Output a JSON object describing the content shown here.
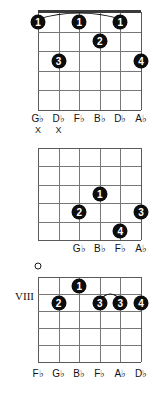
{
  "chart_data": {
    "type": "diagram",
    "subtype": "guitar-chord-charts",
    "string_count": 6,
    "fret_count": 5,
    "diagrams": [
      {
        "id": "diagram-1",
        "position_label": "",
        "has_nut": true,
        "barre": {
          "from_string": 1,
          "to_string": 5,
          "fret": 1
        },
        "dots": [
          {
            "string": 1,
            "fret": 1,
            "finger": "1"
          },
          {
            "string": 3,
            "fret": 1,
            "finger": "1"
          },
          {
            "string": 5,
            "fret": 1,
            "finger": "1"
          },
          {
            "string": 4,
            "fret": 2,
            "finger": "2"
          },
          {
            "string": 2,
            "fret": 3,
            "finger": "3"
          },
          {
            "string": 6,
            "fret": 3,
            "finger": "4"
          }
        ],
        "open_strings": [],
        "muted_strings": [
          1,
          2
        ],
        "note_labels": [
          "G♭",
          "D♭",
          "F♭",
          "B♭",
          "D♭",
          "A♭"
        ],
        "note_label_strings": [
          1,
          2,
          3,
          4,
          5,
          6
        ]
      },
      {
        "id": "diagram-2",
        "position_label": "",
        "has_nut": false,
        "barre": null,
        "dots": [
          {
            "string": 4,
            "fret": 3,
            "finger": "1"
          },
          {
            "string": 3,
            "fret": 4,
            "finger": "2"
          },
          {
            "string": 6,
            "fret": 4,
            "finger": "3"
          },
          {
            "string": 5,
            "fret": 5,
            "finger": "4"
          }
        ],
        "open_strings": [],
        "muted_strings": [],
        "note_labels": [
          "G♭",
          "B♭",
          "F♭",
          "A♭"
        ],
        "note_label_strings": [
          3,
          4,
          5,
          6
        ]
      },
      {
        "id": "diagram-3",
        "position_label": "VIII",
        "has_nut": false,
        "barre": {
          "from_string": 4,
          "to_string": 5,
          "fret": 2
        },
        "dots": [
          {
            "string": 3,
            "fret": 1,
            "finger": "1"
          },
          {
            "string": 2,
            "fret": 2,
            "finger": "2"
          },
          {
            "string": 4,
            "fret": 2,
            "finger": "3"
          },
          {
            "string": 5,
            "fret": 2,
            "finger": "3"
          },
          {
            "string": 6,
            "fret": 2,
            "finger": "4"
          }
        ],
        "open_strings": [
          1
        ],
        "muted_strings": [],
        "note_labels": [
          "F♭",
          "G♭",
          "B♭",
          "F♭",
          "A♭",
          "D♭"
        ],
        "note_label_strings": [
          1,
          2,
          3,
          4,
          5,
          6
        ]
      }
    ],
    "colors": {
      "background": "#ffffff",
      "grid": "#777777",
      "grid_edge": "#5a5a5a",
      "nut": "#3a3a3a",
      "dot_fill": "#0d0d0d",
      "dot_text": "#ffffff",
      "text": "#111111"
    }
  }
}
